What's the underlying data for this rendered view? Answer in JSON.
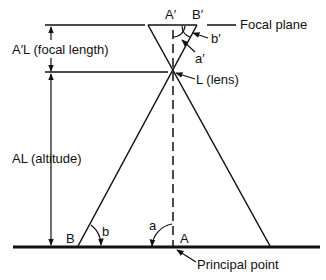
{
  "diagram": {
    "labels": {
      "a_prime": "A′",
      "b_prime": "B′",
      "focal_plane": "Focal plane",
      "b_prime_angle": "b′",
      "a_prime_angle": "a′",
      "lens": "L (lens)",
      "focal_length": "A′L (focal length)",
      "altitude": "AL (altitude)",
      "b_ground": "B",
      "b_angle": "b",
      "a_angle": "a",
      "a_ground": "A",
      "principal_point": "Principal point"
    }
  }
}
